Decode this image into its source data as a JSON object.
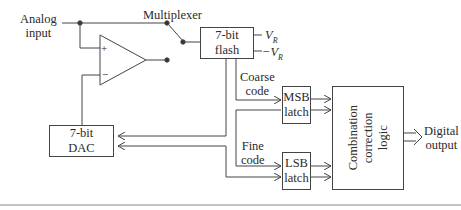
{
  "diagram": {
    "labels": {
      "analog_input_1": "Analog",
      "analog_input_2": "input",
      "multiplexer": "Multiplexer",
      "coarse_code_1": "Coarse",
      "coarse_code_2": "code",
      "fine_code_1": "Fine",
      "fine_code_2": "code",
      "digital_output_1": "Digital",
      "digital_output_2": "output",
      "vr_pos": "V",
      "vr_neg": "−V",
      "vr_sub": "R",
      "opamp_plus": "+",
      "opamp_minus": "−"
    },
    "blocks": {
      "flash_1": "7-bit",
      "flash_2": "flash",
      "dac_1": "7-bit",
      "dac_2": "DAC",
      "msb_1": "MSB",
      "msb_2": "latch",
      "lsb_1": "LSB",
      "lsb_2": "latch",
      "logic_1": "Combination",
      "logic_2": "correction",
      "logic_3": "logic"
    }
  }
}
